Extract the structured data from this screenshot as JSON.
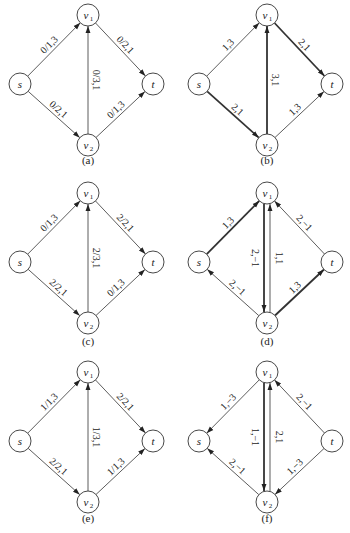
{
  "figure": {
    "node_radius": 11,
    "colors": {
      "stroke": "#333333",
      "text": "#222222",
      "background": "#ffffff"
    },
    "node_layout": {
      "s": {
        "dx": 20,
        "dy": 69
      },
      "v1": {
        "dx": 88,
        "dy": 0
      },
      "v2": {
        "dx": 88,
        "dy": 130
      },
      "t": {
        "dx": 153,
        "dy": 69
      }
    },
    "node_labels": {
      "s": {
        "main": "s",
        "sub": ""
      },
      "v1": {
        "main": "v",
        "sub": "1"
      },
      "v2": {
        "main": "v",
        "sub": "2"
      },
      "t": {
        "main": "t",
        "sub": ""
      }
    },
    "panels": [
      {
        "id": "a",
        "caption": "(a)",
        "ox": 0,
        "oy": 15,
        "caption_y": 164,
        "edges": [
          {
            "from": "s",
            "to": "v1",
            "label": "0/1,3",
            "thick": false,
            "side": -1
          },
          {
            "from": "v1",
            "to": "t",
            "label": "0/2,1",
            "thick": false,
            "side": -1
          },
          {
            "from": "s",
            "to": "v2",
            "label": "0/2,1",
            "thick": false,
            "side": -1
          },
          {
            "from": "v2",
            "to": "t",
            "label": "0/1,3",
            "thick": false,
            "side": 1
          },
          {
            "from": "v2",
            "to": "v1",
            "label": "0/3,1",
            "thick": false,
            "side": 1,
            "offset": 0
          }
        ]
      },
      {
        "id": "b",
        "caption": "(b)",
        "ox": 179,
        "oy": 15,
        "caption_y": 164,
        "edges": [
          {
            "from": "s",
            "to": "v1",
            "label": "1,3",
            "thick": false,
            "side": -1
          },
          {
            "from": "v1",
            "to": "t",
            "label": "2,1",
            "thick": true,
            "side": -1
          },
          {
            "from": "s",
            "to": "v2",
            "label": "2,1",
            "thick": true,
            "side": -1
          },
          {
            "from": "v2",
            "to": "t",
            "label": "1,3",
            "thick": false,
            "side": 1
          },
          {
            "from": "v2",
            "to": "v1",
            "label": "3,1",
            "thick": true,
            "side": 1,
            "offset": 0
          }
        ]
      },
      {
        "id": "c",
        "caption": "(c)",
        "ox": 0,
        "oy": 193,
        "caption_y": 345,
        "edges": [
          {
            "from": "s",
            "to": "v1",
            "label": "0/1,3",
            "thick": false,
            "side": -1
          },
          {
            "from": "v1",
            "to": "t",
            "label": "2/2,1",
            "thick": false,
            "side": -1
          },
          {
            "from": "s",
            "to": "v2",
            "label": "2/2,1",
            "thick": false,
            "side": -1
          },
          {
            "from": "v2",
            "to": "t",
            "label": "0/1,3",
            "thick": false,
            "side": 1
          },
          {
            "from": "v2",
            "to": "v1",
            "label": "2/3,1",
            "thick": false,
            "side": 1,
            "offset": 0
          }
        ]
      },
      {
        "id": "d",
        "caption": "(d)",
        "ox": 179,
        "oy": 193,
        "caption_y": 345,
        "edges": [
          {
            "from": "s",
            "to": "v1",
            "label": "1,3",
            "thick": true,
            "side": -1
          },
          {
            "from": "t",
            "to": "v1",
            "label": "2,−1",
            "thick": false,
            "side": 1
          },
          {
            "from": "v2",
            "to": "s",
            "label": "2,−1",
            "thick": false,
            "side": 1
          },
          {
            "from": "v2",
            "to": "t",
            "label": "1,3",
            "thick": true,
            "side": 1
          },
          {
            "from": "v1",
            "to": "v2",
            "label": "2,−1",
            "thick": true,
            "side": 1,
            "offset": -3
          },
          {
            "from": "v2",
            "to": "v1",
            "label": "1,1",
            "thick": false,
            "side": 1,
            "offset": 3
          }
        ]
      },
      {
        "id": "e",
        "caption": "(e)",
        "ox": 0,
        "oy": 372,
        "caption_y": 522,
        "edges": [
          {
            "from": "s",
            "to": "v1",
            "label": "1/1,3",
            "thick": false,
            "side": -1
          },
          {
            "from": "v1",
            "to": "t",
            "label": "2/2,1",
            "thick": false,
            "side": -1
          },
          {
            "from": "s",
            "to": "v2",
            "label": "2/2,1",
            "thick": false,
            "side": -1
          },
          {
            "from": "v2",
            "to": "t",
            "label": "1/1,3",
            "thick": false,
            "side": 1
          },
          {
            "from": "v2",
            "to": "v1",
            "label": "1/3,1",
            "thick": false,
            "side": 1,
            "offset": 0
          }
        ]
      },
      {
        "id": "f",
        "caption": "(f)",
        "ox": 179,
        "oy": 372,
        "caption_y": 522,
        "edges": [
          {
            "from": "v1",
            "to": "s",
            "label": "1,−3",
            "thick": false,
            "side": 1
          },
          {
            "from": "t",
            "to": "v1",
            "label": "2,−1",
            "thick": false,
            "side": 1
          },
          {
            "from": "v2",
            "to": "s",
            "label": "2,−1",
            "thick": false,
            "side": 1
          },
          {
            "from": "t",
            "to": "v2",
            "label": "1,−3",
            "thick": false,
            "side": -1
          },
          {
            "from": "v1",
            "to": "v2",
            "label": "1,−1",
            "thick": true,
            "side": 1,
            "offset": -3
          },
          {
            "from": "v2",
            "to": "v1",
            "label": "2,1",
            "thick": false,
            "side": 1,
            "offset": 3
          }
        ]
      }
    ]
  }
}
